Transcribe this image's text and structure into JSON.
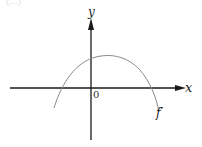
{
  "figure": {
    "corner_text": "(…)",
    "axes": {
      "x_label": "x",
      "y_label": "y",
      "origin_label": "0",
      "color": "#1a1a1a"
    },
    "curve": {
      "label": "f′",
      "shape": "downward-opening parabola",
      "color": "#888888",
      "path": "M54,108 Q70,70 88,60 Q106,52 124,60 Q146,72 159,112"
    }
  }
}
